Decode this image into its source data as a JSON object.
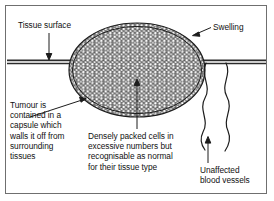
{
  "figure": {
    "type": "biological-diagram",
    "background_color": "#ffffff",
    "border_color": "#6f6f6f",
    "ink_color": "#111111"
  },
  "labels": {
    "tissue_surface": "Tissue surface",
    "swelling": "Swelling",
    "tumour_capsule": "Tumour is\ncontained in a\ncapsule which\nwalls it off from\nsurrounding\ntissues",
    "densely_packed_cells": "Densely packed cells in\nexcessive numbers but\nrecognisable as normal\nfor their tissue type",
    "blood_vessels": "Unaffected\nblood vessels"
  },
  "diagram_parts": {
    "tissue_surface_line": "horizontal double line across figure",
    "tumour_mass": "encapsulated ellipse filled with densely packed round cells",
    "capsule": "double outline around tumour mass",
    "blood_vessels": "two wavy vertical lines below tissue surface on the right"
  }
}
